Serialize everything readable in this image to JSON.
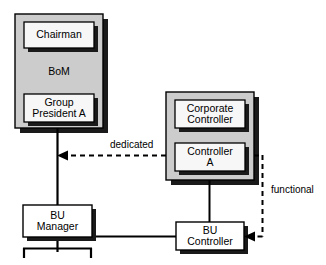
{
  "diagram": {
    "type": "organizational-chart",
    "title": "",
    "colors": {
      "group_fill": "#cccccc",
      "box_fill": "#f7f7f7",
      "stroke": "#000000",
      "shadow": "#1a1a1a",
      "background": "#ffffff"
    },
    "groups": [
      {
        "id": "bom-group",
        "caption": "BoM",
        "x": 15,
        "y": 14,
        "w": 88,
        "h": 114,
        "caption_x": 15,
        "caption_y": 65,
        "caption_w": 88
      },
      {
        "id": "corporate-group",
        "caption": "",
        "x": 166,
        "y": 92,
        "w": 88,
        "h": 88,
        "caption_x": 0,
        "caption_y": 0,
        "caption_w": 0
      }
    ],
    "nodes": [
      {
        "id": "chairman",
        "label": "Chairman",
        "x": 24,
        "y": 22,
        "w": 70,
        "h": 26
      },
      {
        "id": "group-president-a",
        "label": "Group\nPresident A",
        "x": 24,
        "y": 94,
        "w": 70,
        "h": 28
      },
      {
        "id": "corporate-controller",
        "label": "Corporate\nController",
        "x": 175,
        "y": 100,
        "w": 70,
        "h": 28
      },
      {
        "id": "controller-a",
        "label": "Controller\nA",
        "x": 175,
        "y": 143,
        "w": 70,
        "h": 28
      },
      {
        "id": "bu-manager",
        "label": "BU\nManager",
        "x": 23,
        "y": 205,
        "w": 69,
        "h": 32
      },
      {
        "id": "bu-controller",
        "label": "BU\nController",
        "x": 176,
        "y": 222,
        "w": 68,
        "h": 28
      }
    ],
    "edge_labels": [
      {
        "id": "dedicated-label",
        "text": "dedicated",
        "x": 110,
        "y": 139
      },
      {
        "id": "functional-label",
        "text": "functional",
        "x": 271,
        "y": 184
      }
    ],
    "connections": [
      {
        "id": "bom-to-bu-manager",
        "style": "solid",
        "from": "bom-group",
        "to": "bu-manager"
      },
      {
        "id": "bu-manager-to-bracket",
        "style": "solid",
        "from": "bu-manager",
        "to": "subordinate-bracket"
      },
      {
        "id": "bu-manager-to-bu-controller",
        "style": "solid",
        "from": "bu-manager",
        "to": "bu-controller"
      },
      {
        "id": "controller-a-to-bu-controller",
        "style": "solid",
        "from": "controller-a",
        "to": "bu-controller"
      },
      {
        "id": "dedicated-arrow",
        "style": "dashed",
        "from": "controller-a",
        "to": "group-president-a",
        "label": "dedicated"
      },
      {
        "id": "functional-arrow",
        "style": "dashed",
        "from": "controller-a",
        "to": "bu-controller",
        "label": "functional"
      }
    ]
  }
}
